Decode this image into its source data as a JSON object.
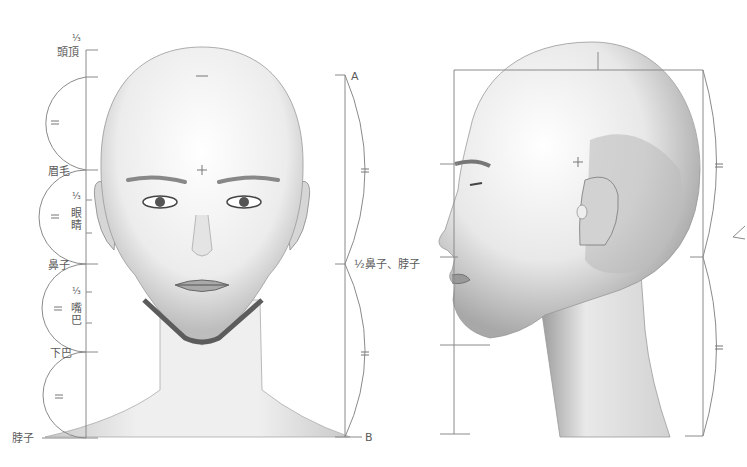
{
  "front_view": {
    "left_scale": {
      "labels": {
        "top_fraction": "⅓",
        "crown": "頭頂",
        "eyebrow": "眉毛",
        "eye_fraction": "⅓",
        "eyes": "眼睛",
        "nose": "鼻子",
        "mouth_fraction": "⅓",
        "mouth": "嘴巴",
        "chin": "下巴",
        "neck": "脖子"
      },
      "equal_marks": [
        "=",
        "=",
        "=",
        "="
      ]
    },
    "right_scale": {
      "top_label": "A",
      "middle_label": "½鼻子、脖子",
      "bottom_label": "B",
      "equal_marks": [
        "=",
        "="
      ]
    }
  },
  "side_view": {
    "right_scale": {
      "equal_marks": [
        "=",
        "="
      ]
    }
  },
  "colors": {
    "line": "#8a8a8a",
    "text": "#5a5a5a",
    "shade_dark": "#6e6e6e",
    "shade_mid": "#b5b5b5",
    "background": "#ffffff"
  }
}
